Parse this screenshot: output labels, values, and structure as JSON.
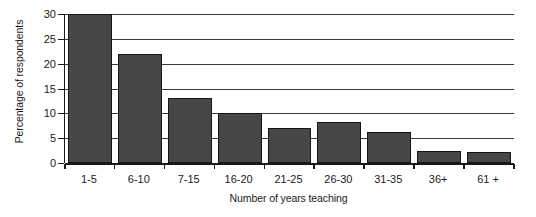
{
  "chart_data": {
    "type": "bar",
    "title": "",
    "xlabel": "Number of years teaching",
    "ylabel": "Percentage of respondents",
    "categories": [
      "1-5",
      "6-10",
      "7-15",
      "16-20",
      "21-25",
      "26-30",
      "31-35",
      "36+",
      "61 +"
    ],
    "values": [
      30,
      22,
      13,
      10,
      7,
      8.2,
      6.2,
      2.5,
      2.2
    ],
    "ylim": [
      0,
      30
    ],
    "yticks": [
      0,
      5,
      10,
      15,
      20,
      25,
      30
    ],
    "ytick_labels": [
      "0",
      "5",
      "10",
      "15",
      "20",
      "25",
      "30"
    ],
    "grid": "horizontal",
    "legend": "none",
    "bar_color": "#474747",
    "bar_edge_color": "#161616",
    "axis_color": "#1a1a1a",
    "gridline_color": "#3b3b3b",
    "background": "#ffffff"
  }
}
